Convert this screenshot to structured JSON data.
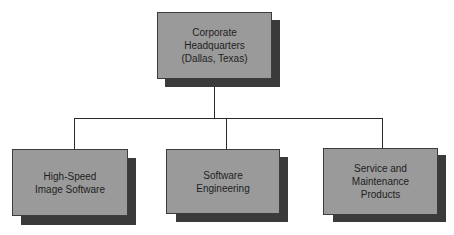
{
  "diagram": {
    "type": "org-chart",
    "colors": {
      "box_fill": "#9a9a9a",
      "box_border": "#3c3c3c",
      "shadow": "#3a3a3a",
      "connector": "#2a2a2a",
      "background": "#ffffff"
    },
    "root": {
      "label_lines": [
        "Corporate",
        "Headquarters",
        "(Dallas, Texas)"
      ]
    },
    "children": [
      {
        "label_lines": [
          "High-Speed",
          "Image Software"
        ]
      },
      {
        "label_lines": [
          "Software",
          "Engineering"
        ]
      },
      {
        "label_lines": [
          "Service and",
          "Maintenance",
          "Products"
        ]
      }
    ]
  }
}
